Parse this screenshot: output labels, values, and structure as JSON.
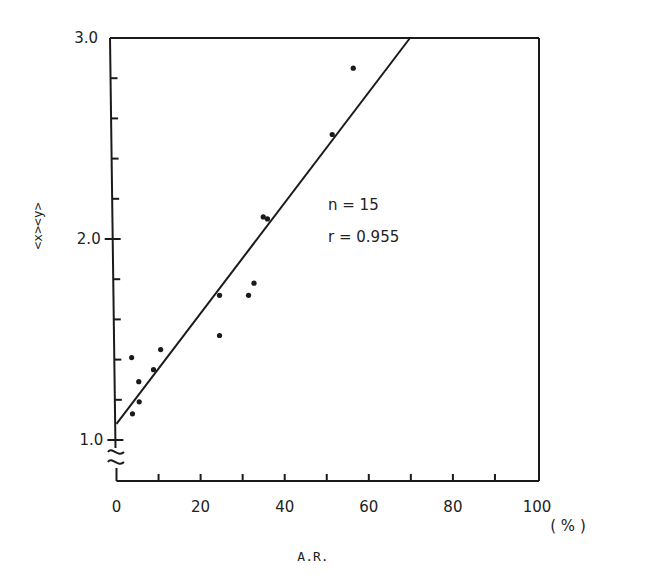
{
  "chart_data": {
    "type": "scatter",
    "title": "",
    "xlabel": "A.R.",
    "x_unit": "( % )",
    "ylabel": "<x><y>",
    "xlim": [
      0,
      100
    ],
    "ylim": [
      1.0,
      3.0
    ],
    "y_axis_break": true,
    "x_ticks": [
      0,
      20,
      40,
      60,
      80,
      100
    ],
    "x_minor_ticks": [
      10,
      30,
      50,
      70,
      90
    ],
    "y_ticks": [
      1.0,
      2.0,
      3.0
    ],
    "y_tick_labels": [
      "1.0",
      "2.0",
      "3.0"
    ],
    "y_minor_ticks": [
      1.2,
      1.4,
      1.6,
      1.8,
      2.2,
      2.4,
      2.6,
      2.8
    ],
    "grid": false,
    "legend": null,
    "annotations": [
      "n = 15",
      "r = 0.955"
    ],
    "points": [
      {
        "x": 3.6,
        "y": 1.41
      },
      {
        "x": 3.8,
        "y": 1.13
      },
      {
        "x": 5.3,
        "y": 1.29
      },
      {
        "x": 5.4,
        "y": 1.19
      },
      {
        "x": 8.8,
        "y": 1.35
      },
      {
        "x": 10.5,
        "y": 1.45
      },
      {
        "x": 24.5,
        "y": 1.72
      },
      {
        "x": 24.5,
        "y": 1.52
      },
      {
        "x": 31.4,
        "y": 1.72
      },
      {
        "x": 32.7,
        "y": 1.78
      },
      {
        "x": 34.9,
        "y": 2.11
      },
      {
        "x": 35.9,
        "y": 2.1
      },
      {
        "x": 51.3,
        "y": 2.52
      },
      {
        "x": 56.3,
        "y": 2.85
      }
    ],
    "regression_line": {
      "x0": 0,
      "y0": 1.08,
      "x1": 69.8,
      "y1": 3.0
    }
  },
  "labels": {
    "xlabel": "A.R.",
    "x_unit": "( % )",
    "ylabel": "<x><y>",
    "annot_n": "n = 15",
    "annot_r": "r = 0.955"
  }
}
